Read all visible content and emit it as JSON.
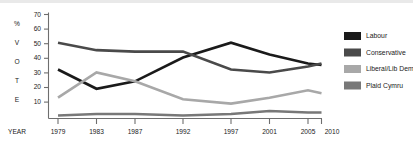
{
  "chart_data": {
    "type": "line",
    "title": "",
    "xlabel": "YEAR",
    "ylabel": "% VOTE",
    "ylabel_letters": [
      "%",
      "V",
      "O",
      "T",
      "E"
    ],
    "categories": [
      "1979",
      "1983",
      "1987",
      "1992",
      "1997",
      "2001",
      "2005",
      "2010"
    ],
    "x": [
      1979,
      1983,
      1987,
      1992,
      1997,
      2001,
      2005,
      2010
    ],
    "yticks": [
      10,
      20,
      30,
      40,
      50,
      60,
      70
    ],
    "ylim": [
      0,
      70
    ],
    "grid": false,
    "legend_position": "right",
    "series": [
      {
        "name": "Labour",
        "color": "#1a1a1a",
        "values": [
          33,
          20,
          25,
          41,
          51,
          43,
          37,
          36
        ]
      },
      {
        "name": "Conservative",
        "color": "#4a4a4a",
        "values": [
          51,
          46,
          45,
          45,
          33,
          31,
          35,
          37
        ]
      },
      {
        "name": "Liberal/Lib Dem",
        "color": "#a8a8a8",
        "values": [
          14,
          31,
          25,
          13,
          10,
          14,
          19,
          17
        ]
      },
      {
        "name": "Plaid Cymru",
        "color": "#787878",
        "values": [
          2,
          3,
          3,
          2,
          3,
          5,
          4,
          4
        ]
      }
    ]
  },
  "legend": {
    "items": [
      {
        "label": "Labour",
        "color": "#1a1a1a"
      },
      {
        "label": "Conservative",
        "color": "#4a4a4a"
      },
      {
        "label": "Liberal/Lib Dem",
        "color": "#a8a8a8"
      },
      {
        "label": "Plaid Cymru",
        "color": "#787878"
      }
    ]
  },
  "axes": {
    "x_title": "YEAR",
    "y_letters": [
      "%",
      "V",
      "O",
      "T",
      "E"
    ],
    "y_ticks": [
      "70",
      "60",
      "50",
      "40",
      "30",
      "20",
      "10"
    ],
    "x_ticks": [
      "1979",
      "1983",
      "1987",
      "1992",
      "1997",
      "2001",
      "2005",
      "2010"
    ]
  }
}
